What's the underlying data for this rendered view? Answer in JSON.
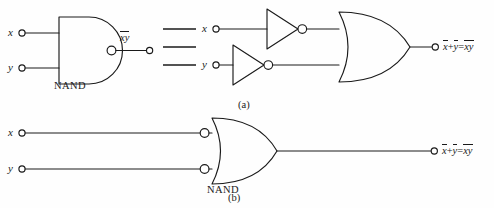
{
  "figure": {
    "stroke_color": "#1a1a1a",
    "background_color": "#fefefe"
  },
  "row_a": {
    "caption": "(a)",
    "equivalence_symbol": "≡",
    "left_circuit": {
      "inputs": [
        {
          "label": "x"
        },
        {
          "label": "y"
        }
      ],
      "gate": {
        "type": "nand",
        "name": "NAND"
      },
      "output_label": {
        "overbar": "xy"
      }
    },
    "right_circuit": {
      "inputs": [
        {
          "label": "x"
        },
        {
          "label": "y"
        }
      ],
      "inverters": [
        {
          "type": "not"
        },
        {
          "type": "not"
        }
      ],
      "gate": {
        "type": "or"
      },
      "output_equation": {
        "term1": "x",
        "operator": "+",
        "term2": "y",
        "equals": "=",
        "result": "xy"
      }
    }
  },
  "row_b": {
    "caption": "(b)",
    "circuit": {
      "inputs": [
        {
          "label": "x"
        },
        {
          "label": "y"
        }
      ],
      "gate": {
        "type": "or-with-input-bubbles",
        "name": "NAND"
      },
      "output_equation": {
        "term1": "x",
        "operator": "+",
        "term2": "y",
        "equals": "=",
        "result": "xy"
      }
    }
  }
}
